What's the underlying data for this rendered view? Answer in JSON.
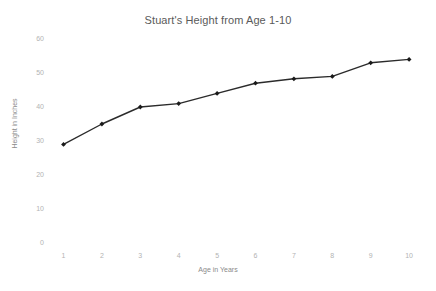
{
  "chart_data": {
    "type": "line",
    "title": "Stuart's Height from Age 1-10",
    "xlabel": "Age in Years",
    "ylabel": "Height in Inches",
    "x": [
      1,
      2,
      3,
      4,
      5,
      6,
      7,
      8,
      9,
      10
    ],
    "values": [
      29,
      35,
      40,
      41,
      44,
      47,
      48.3,
      49,
      53,
      54
    ],
    "categories": [
      "1",
      "2",
      "3",
      "4",
      "5",
      "6",
      "7",
      "8",
      "9",
      "10"
    ],
    "xtick_labels": [
      "1",
      "2",
      "3",
      "4",
      "5",
      "6",
      "7",
      "8",
      "9",
      "10"
    ],
    "ytick_labels": [
      "0",
      "10",
      "20",
      "30",
      "40",
      "50",
      "60"
    ],
    "ytick_values": [
      0,
      10,
      20,
      30,
      40,
      50,
      60
    ],
    "xlim": [
      0.5,
      10.5
    ],
    "ylim": [
      0,
      60
    ],
    "grid": false,
    "legend": false,
    "legend_position": "none",
    "series": [
      {
        "name": "Height",
        "values": [
          29,
          35,
          40,
          41,
          44,
          47,
          48.3,
          49,
          53,
          54
        ]
      }
    ],
    "line_color": "#2b2b2b",
    "marker": "diamond",
    "marker_color": "#1a1a1a",
    "title_color": "#5a5a5a",
    "tick_color": "#b3b3b3",
    "axis_label_color": "#8a8a8a",
    "background_color": "#ffffff"
  }
}
